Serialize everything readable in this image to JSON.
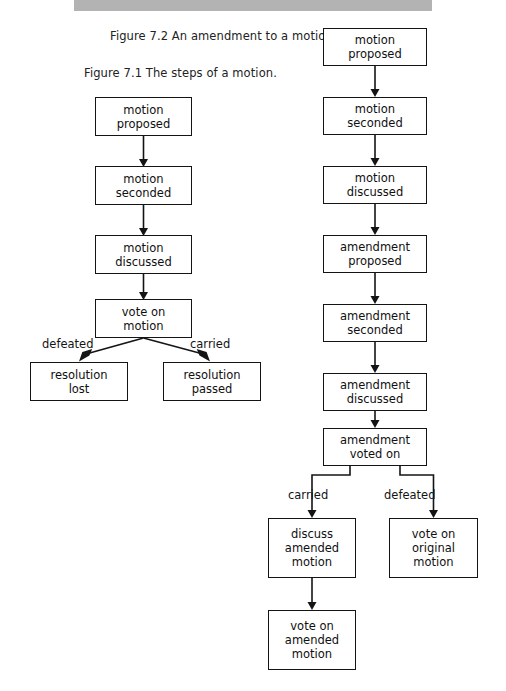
{
  "topbar": {
    "text": ""
  },
  "captions": [
    {
      "id": "fig-7-2",
      "text": "Figure 7.2 An amendment to a motion."
    },
    {
      "id": "fig-7-1",
      "text": "Figure 7.1 The steps of a motion."
    }
  ],
  "figure_7_1": {
    "caption": "Figure 7.1 The steps of a motion.",
    "nodes": [
      {
        "id": "l1",
        "line1": "motion",
        "line2": "proposed",
        "line3": ""
      },
      {
        "id": "l2",
        "line1": "motion",
        "line2": "seconded",
        "line3": ""
      },
      {
        "id": "l3",
        "line1": "motion",
        "line2": "discussed",
        "line3": ""
      },
      {
        "id": "l4",
        "line1": "vote on",
        "line2": "motion",
        "line3": ""
      },
      {
        "id": "l5",
        "line1": "resolution",
        "line2": "lost",
        "line3": ""
      },
      {
        "id": "l6",
        "line1": "resolution",
        "line2": "passed",
        "line3": ""
      }
    ],
    "edge_labels": [
      {
        "id": "l-defeated",
        "text": "defeated"
      },
      {
        "id": "l-carried",
        "text": "carried"
      }
    ]
  },
  "figure_7_2": {
    "caption": "Figure 7.2 An amendment to a motion.",
    "nodes": [
      {
        "id": "r1",
        "line1": "motion",
        "line2": "proposed",
        "line3": ""
      },
      {
        "id": "r2",
        "line1": "motion",
        "line2": "seconded",
        "line3": ""
      },
      {
        "id": "r3",
        "line1": "motion",
        "line2": "discussed",
        "line3": ""
      },
      {
        "id": "r4",
        "line1": "amendment",
        "line2": "proposed",
        "line3": ""
      },
      {
        "id": "r5",
        "line1": "amendment",
        "line2": "seconded",
        "line3": ""
      },
      {
        "id": "r6",
        "line1": "amendment",
        "line2": "discussed",
        "line3": ""
      },
      {
        "id": "r7",
        "line1": "amendment",
        "line2": "voted on",
        "line3": ""
      },
      {
        "id": "r8",
        "line1": "discuss",
        "line2": "amended",
        "line3": "motion"
      },
      {
        "id": "r9",
        "line1": "vote on",
        "line2": "original",
        "line3": "motion"
      },
      {
        "id": "r10",
        "line1": "vote on",
        "line2": "amended",
        "line3": "motion"
      }
    ],
    "edge_labels": [
      {
        "id": "r-carried",
        "text": "carried"
      },
      {
        "id": "r-defeated",
        "text": "defeated"
      }
    ]
  },
  "colors": {
    "topbar": "#b3b3b3",
    "stroke": "#141414",
    "page": "#ffffff",
    "text": "#101010"
  }
}
